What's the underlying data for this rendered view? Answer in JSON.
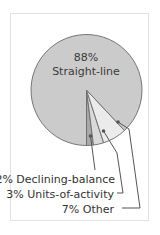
{
  "chart_data": {
    "type": "pie",
    "title": "",
    "categories": [
      "Straight-line",
      "Declining-balance",
      "Units-of-activity",
      "Other"
    ],
    "values": [
      88,
      2,
      3,
      7
    ],
    "unit": "%",
    "colors": [
      "#cbcbcb",
      "#a9a9a9",
      "#d9d9d9",
      "#ebebeb"
    ],
    "labels": {
      "main_pct": "88%",
      "main_name": "Straight-line",
      "declining": "2% Declining-balance",
      "units": "3% Units-of-activity",
      "other": "7% Other"
    },
    "legend": "leader-line labels below pie",
    "outline_color": "#6a6a6a",
    "leader_color": "#555555"
  }
}
